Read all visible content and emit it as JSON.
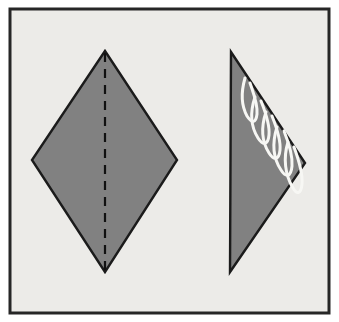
{
  "figure": {
    "title": "Paper folding diagram: kite with vertical fold line and resulting folded half with torn fringe edge",
    "canvas": {
      "width": 339,
      "height": 322,
      "page_background": "#ffffff"
    },
    "frame": {
      "name": "outer-border-frame",
      "x": 10,
      "y": 9,
      "width": 319,
      "height": 304,
      "fill": "#ecebe8",
      "stroke": "#262626",
      "stroke_width": 3
    },
    "shapes": [
      {
        "id": "left-kite",
        "label": "Unfolded kite shape",
        "type": "polygon",
        "points": "105,51 177,160 105,272 32,160",
        "fill": "#818181",
        "stroke": "#1b1b1b",
        "stroke_width": 2.4,
        "vertices": {
          "top": [
            105,
            51
          ],
          "right": [
            177,
            160
          ],
          "bottom": [
            105,
            272
          ],
          "left": [
            32,
            160
          ]
        }
      },
      {
        "id": "right-triangle",
        "label": "Folded half with fringe",
        "type": "polygon",
        "points": "231,52 305,163 230,272",
        "fill": "#818181",
        "stroke": "#1b1b1b",
        "stroke_width": 2.4,
        "vertices": {
          "top": [
            231,
            52
          ],
          "right": [
            305,
            163
          ],
          "bottom": [
            230,
            272
          ]
        }
      }
    ],
    "fold_line": {
      "id": "vertical-fold-line",
      "label": "Dashed fold line",
      "x1": 105,
      "y1": 53,
      "x2": 105,
      "y2": 270,
      "stroke": "#111111",
      "stroke_width": 2.2,
      "dash_pattern": "9 7"
    },
    "fringe_marks": {
      "id": "white-fringe-strokes",
      "label": "White hand drawn fringe strokes along the folded edge",
      "stroke": "#f7f7f4",
      "stroke_width": 3.0,
      "count": 5,
      "paths": [
        "M 245 78 C 241 92 241 105 247 116 C 252 124 256 123 257 114 C 258 104 253 92 250 83",
        "M 255 97 C 250 112 251 127 258 138 C 263 146 268 145 269 135 C 270 124 265 111 261 101",
        "M 266 112 C 261 127 262 142 269 153 C 274 161 279 160 280 150 C 281 139 276 126 272 116",
        "M 277 127 C 272 143 273 158 281 170 C 286 178 291 177 292 166 C 293 154 288 141 284 131",
        "M 288 142 C 283 158 285 175 293 188 C 297 195 301 194 302 184 C 303 173 298 158 294 147"
      ]
    }
  }
}
